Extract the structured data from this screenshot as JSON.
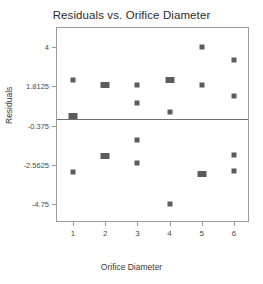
{
  "chart_data": {
    "type": "scatter",
    "title": "Residuals vs. Orifice Diameter",
    "xlabel": "Orifice Diameter",
    "ylabel": "Residuals",
    "grid": false,
    "legend": false,
    "xlim": [
      0.5,
      6.5
    ],
    "ylim": [
      -5.84,
      5.09
    ],
    "xticks": [
      1,
      2,
      3,
      4,
      5,
      6
    ],
    "xticklabels": [
      "1",
      "2",
      "3",
      "4",
      "5",
      "6"
    ],
    "yticks": [
      4,
      1.8125,
      -0.375,
      -2.5625,
      -4.75
    ],
    "yticklabels": [
      "4",
      "1.8125",
      "-0.375",
      "-2.5625",
      "-4.75"
    ],
    "reference_line": 0.0,
    "marker_style": "square",
    "marker_color": "#5c5c5c",
    "points": [
      {
        "x": 1,
        "y": 2.15,
        "overlap": false
      },
      {
        "x": 1,
        "y": 0.17,
        "overlap": true
      },
      {
        "x": 1,
        "y": -2.99,
        "overlap": false
      },
      {
        "x": 2,
        "y": 1.88,
        "overlap": true
      },
      {
        "x": 2,
        "y": -2.06,
        "overlap": true
      },
      {
        "x": 3,
        "y": 1.88,
        "overlap": false
      },
      {
        "x": 3,
        "y": 0.88,
        "overlap": false
      },
      {
        "x": 3,
        "y": -1.17,
        "overlap": false
      },
      {
        "x": 3,
        "y": -2.5,
        "overlap": false
      },
      {
        "x": 4,
        "y": 2.15,
        "overlap": true
      },
      {
        "x": 4,
        "y": 0.4,
        "overlap": false
      },
      {
        "x": 4,
        "y": -4.75,
        "overlap": false
      },
      {
        "x": 5,
        "y": 4.0,
        "overlap": false
      },
      {
        "x": 5,
        "y": 1.88,
        "overlap": false
      },
      {
        "x": 5,
        "y": -3.1,
        "overlap": true
      },
      {
        "x": 6,
        "y": 3.3,
        "overlap": false
      },
      {
        "x": 6,
        "y": 1.3,
        "overlap": false
      },
      {
        "x": 6,
        "y": -2.05,
        "overlap": false
      },
      {
        "x": 6,
        "y": -2.93,
        "overlap": false
      }
    ]
  },
  "colors": {
    "frame": "#9a9a9a",
    "marker": "#5c5c5c",
    "reference_line": "#6e6e6e",
    "text": "#3a3a3a",
    "background": "#ffffff"
  }
}
